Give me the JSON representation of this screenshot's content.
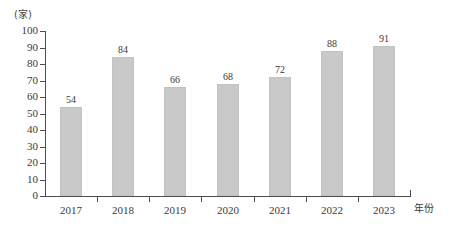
{
  "chart_data": {
    "type": "bar",
    "title": "",
    "subtitle": "",
    "xlabel": "年份",
    "ylabel": "(家)",
    "categories": [
      "2017",
      "2018",
      "2019",
      "2020",
      "2021",
      "2022",
      "2023"
    ],
    "values": [
      54,
      84,
      66,
      68,
      72,
      88,
      91
    ],
    "data_labels": [
      "54",
      "84",
      "66",
      "68",
      "72",
      "88",
      "91"
    ],
    "ylim": [
      0,
      100
    ],
    "ytick_step": 10,
    "yticks": [
      "100",
      "90",
      "80",
      "70",
      "60",
      "50",
      "40",
      "30",
      "20",
      "10",
      "0"
    ],
    "ytick_values": [
      100,
      90,
      80,
      70,
      60,
      50,
      40,
      30,
      20,
      10,
      0
    ],
    "grid": false,
    "legend": null,
    "legend_position": "none",
    "series": [
      {
        "name": "",
        "values": [
          54,
          84,
          66,
          68,
          72,
          88,
          91
        ]
      }
    ],
    "colors": {
      "bar_fill": "#c9c9c9",
      "bar_border": "#c2c2c2",
      "axis": "#4d4d4d",
      "text": "#3a3a3a",
      "background": "#ffffff"
    }
  }
}
